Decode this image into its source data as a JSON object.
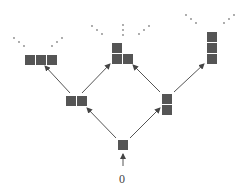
{
  "diagram": {
    "type": "young-lattice",
    "colors": {
      "cell": "#555555",
      "edge": "#555555",
      "dots": "#888888",
      "background": "#ffffff"
    },
    "root_label": "0",
    "nodes": [
      {
        "id": "n1",
        "shape": "single",
        "cells": 1
      },
      {
        "id": "n2a",
        "shape": "row-2",
        "cells": 2
      },
      {
        "id": "n2b",
        "shape": "column-2",
        "cells": 2
      },
      {
        "id": "n3a",
        "shape": "row-3",
        "cells": 3
      },
      {
        "id": "n3b",
        "shape": "L-2-1",
        "cells": 3
      },
      {
        "id": "n3c",
        "shape": "column-3",
        "cells": 3
      }
    ],
    "edges": [
      {
        "from": "0",
        "to": "n1"
      },
      {
        "from": "n1",
        "to": "n2a"
      },
      {
        "from": "n1",
        "to": "n2b"
      },
      {
        "from": "n2a",
        "to": "n3a"
      },
      {
        "from": "n2a",
        "to": "n3b"
      },
      {
        "from": "n2b",
        "to": "n3b"
      },
      {
        "from": "n2b",
        "to": "n3c"
      }
    ],
    "continuation": "ellipsis dots above each top node"
  }
}
